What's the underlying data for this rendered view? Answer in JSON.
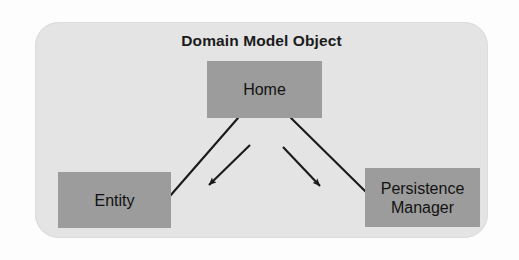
{
  "diagram": {
    "title": "Domain Model Object",
    "type": "block-diagram",
    "container": {
      "label": "Domain Model Object",
      "background_color": "#e4e4e4",
      "corner_radius_px": 24
    },
    "node_fill_color": "#9c9c9c",
    "connector_color": "#1a1a1a",
    "nodes": [
      {
        "id": "home",
        "label": "Home",
        "x": 207,
        "y": 61,
        "width": 115,
        "height": 57
      },
      {
        "id": "entity",
        "label": "Entity",
        "x": 58,
        "y": 172,
        "width": 113,
        "height": 56
      },
      {
        "id": "persistence-manager",
        "label": "Persistence\nManager",
        "x": 365,
        "y": 168,
        "width": 115,
        "height": 59
      }
    ],
    "connectors": [
      {
        "id": "home-to-entity",
        "from": "home",
        "to": "entity",
        "arrowhead": false
      },
      {
        "id": "home-to-persistence-manager",
        "from": "home",
        "to": "persistence-manager",
        "arrowhead": false
      },
      {
        "id": "home-arrow-left",
        "from": "home",
        "to": "",
        "arrowhead": true,
        "direction": "down-left"
      },
      {
        "id": "home-arrow-right",
        "from": "home",
        "to": "",
        "arrowhead": true,
        "direction": "down-right"
      }
    ]
  }
}
